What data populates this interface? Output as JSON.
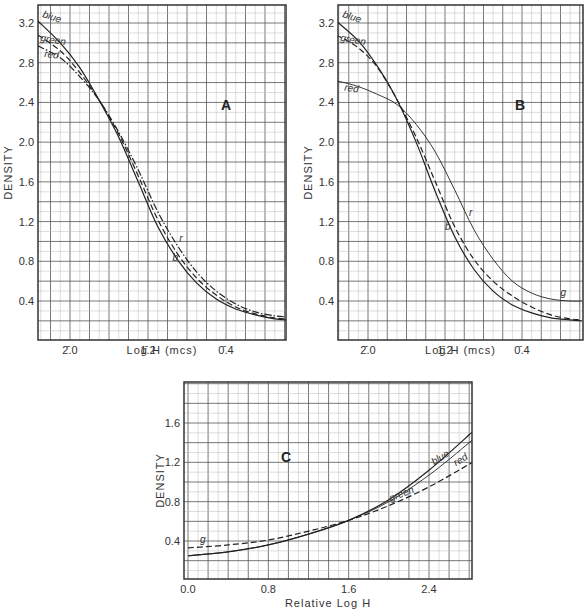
{
  "chart_data": [
    {
      "type": "line",
      "panel": "A",
      "title": "A",
      "xlabel": "Log H (mcs)",
      "ylabel": "DENSITY",
      "x_tick_labels": [
        "2̄.0",
        "1̄.2",
        "0̄.4"
      ],
      "x_tick_values": [
        -2.0,
        -1.2,
        -0.4
      ],
      "xlim": [
        -2.33,
        0.22
      ],
      "y_tick_labels": [
        "3.2",
        "2.8",
        "2.4",
        "2.0",
        "1.6",
        "1.2",
        "0.8",
        "0.4"
      ],
      "ylim": [
        0.0,
        3.38
      ],
      "grid": true,
      "series": [
        {
          "name": "blue",
          "label": "blue",
          "short": "b",
          "style": "solid",
          "x": [
            -2.33,
            -2.1,
            -1.9,
            -1.7,
            -1.5,
            -1.3,
            -1.1,
            -0.9,
            -0.7,
            -0.5,
            -0.3,
            -0.1,
            0.1,
            0.22
          ],
          "y": [
            3.22,
            3.0,
            2.75,
            2.42,
            2.05,
            1.6,
            1.15,
            0.82,
            0.58,
            0.42,
            0.32,
            0.26,
            0.22,
            0.21
          ]
        },
        {
          "name": "green",
          "label": "green",
          "short": "g",
          "style": "dashed",
          "x": [
            -2.33,
            -2.1,
            -1.9,
            -1.7,
            -1.5,
            -1.3,
            -1.1,
            -0.9,
            -0.7,
            -0.5,
            -0.3,
            -0.1,
            0.1,
            0.22
          ],
          "y": [
            3.08,
            2.92,
            2.7,
            2.42,
            2.08,
            1.66,
            1.22,
            0.88,
            0.63,
            0.46,
            0.34,
            0.27,
            0.23,
            0.22
          ]
        },
        {
          "name": "red",
          "label": "red",
          "short": "r",
          "style": "dash-dot",
          "x": [
            -2.33,
            -2.1,
            -1.9,
            -1.7,
            -1.5,
            -1.3,
            -1.1,
            -0.9,
            -0.7,
            -0.5,
            -0.3,
            -0.1,
            0.1,
            0.22
          ],
          "y": [
            2.97,
            2.85,
            2.66,
            2.42,
            2.1,
            1.72,
            1.3,
            0.96,
            0.69,
            0.5,
            0.37,
            0.29,
            0.25,
            0.24
          ]
        }
      ]
    },
    {
      "type": "line",
      "panel": "B",
      "title": "B",
      "xlabel": "Log H (mcs)",
      "ylabel": "DENSITY",
      "x_tick_labels": [
        "2̄.0",
        "1̄.2",
        "0̄.4"
      ],
      "x_tick_values": [
        -2.0,
        -1.2,
        -0.4
      ],
      "xlim": [
        -2.33,
        0.22
      ],
      "y_tick_labels": [
        "3.2",
        "2.8",
        "2.4",
        "2.0",
        "1.6",
        "1.2",
        "0.8",
        "0.4"
      ],
      "ylim": [
        0.0,
        3.38
      ],
      "grid": true,
      "series": [
        {
          "name": "blue",
          "label": "blue",
          "short": "b",
          "style": "solid",
          "x": [
            -2.33,
            -2.1,
            -1.9,
            -1.7,
            -1.5,
            -1.3,
            -1.1,
            -0.9,
            -0.7,
            -0.5,
            -0.3,
            -0.1,
            0.1,
            0.22
          ],
          "y": [
            3.22,
            3.02,
            2.76,
            2.43,
            2.0,
            1.5,
            1.05,
            0.72,
            0.5,
            0.36,
            0.28,
            0.23,
            0.21,
            0.2
          ]
        },
        {
          "name": "green",
          "label": "green",
          "short": "g",
          "style": "dashed",
          "x": [
            -2.33,
            -2.1,
            -1.9,
            -1.7,
            -1.5,
            -1.3,
            -1.1,
            -0.9,
            -0.7,
            -0.5,
            -0.3,
            -0.1,
            0.1,
            0.22
          ],
          "y": [
            3.08,
            2.95,
            2.75,
            2.43,
            2.05,
            1.6,
            1.15,
            0.82,
            0.6,
            0.45,
            0.34,
            0.26,
            0.22,
            0.21
          ]
        },
        {
          "name": "red",
          "label": "red",
          "short": "r",
          "style": "solid-thin",
          "x": [
            -2.33,
            -2.1,
            -1.9,
            -1.7,
            -1.5,
            -1.3,
            -1.1,
            -0.9,
            -0.7,
            -0.5,
            -0.3,
            -0.1,
            0.1,
            0.22
          ],
          "y": [
            2.62,
            2.56,
            2.48,
            2.38,
            2.18,
            1.9,
            1.52,
            1.12,
            0.82,
            0.6,
            0.48,
            0.42,
            0.4,
            0.4
          ]
        }
      ],
      "annotations": [
        {
          "text": "g",
          "near": "green tail ~ (0.0, 0.45)"
        }
      ]
    },
    {
      "type": "line",
      "panel": "C",
      "title": "C",
      "xlabel": "Relative  Log H",
      "ylabel": "DENSITY",
      "x_tick_labels": [
        "0.0",
        "0.8",
        "1.6",
        "2.4"
      ],
      "x_tick_values": [
        0.0,
        0.8,
        1.6,
        2.4
      ],
      "xlim": [
        0.0,
        2.9
      ],
      "y_tick_labels": [
        "1.6",
        "1.2",
        "0.8",
        "0.4"
      ],
      "y_tick_values": [
        1.6,
        1.2,
        0.8,
        0.4
      ],
      "ylim": [
        0.0,
        1.95
      ],
      "grid": true,
      "series": [
        {
          "name": "blue",
          "label": "blue",
          "style": "solid",
          "x": [
            0.0,
            0.4,
            0.8,
            1.2,
            1.6,
            2.0,
            2.4,
            2.8,
            2.9
          ],
          "y": [
            0.25,
            0.29,
            0.36,
            0.47,
            0.61,
            0.82,
            1.12,
            1.48,
            1.58
          ]
        },
        {
          "name": "red",
          "label": "red",
          "style": "solid-thin",
          "x": [
            0.0,
            0.4,
            0.8,
            1.2,
            1.6,
            2.0,
            2.4,
            2.8,
            2.9
          ],
          "y": [
            0.25,
            0.29,
            0.36,
            0.47,
            0.61,
            0.8,
            1.07,
            1.4,
            1.5
          ]
        },
        {
          "name": "green",
          "label": "green",
          "short": "g",
          "style": "dashed",
          "x": [
            0.0,
            0.4,
            0.8,
            1.2,
            1.6,
            2.0,
            2.4,
            2.8,
            2.9
          ],
          "y": [
            0.33,
            0.36,
            0.41,
            0.5,
            0.61,
            0.76,
            0.95,
            1.18,
            1.24
          ]
        }
      ]
    }
  ],
  "panels": {
    "A": {
      "label": "A",
      "xlabel": "Log H  (mcs)",
      "ylabel": "DENSITY"
    },
    "B": {
      "label": "B",
      "xlabel": "Log H  (mcs)",
      "ylabel": "DENSITY"
    },
    "C": {
      "label": "C",
      "xlabel": "Relative  Log H",
      "ylabel": "DENSITY"
    }
  },
  "colors": {
    "grid_major": "#555555",
    "grid_minor": "#bbbbbb",
    "curve": "#222222",
    "frame": "#333333"
  }
}
